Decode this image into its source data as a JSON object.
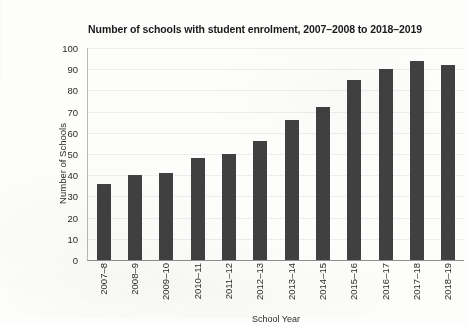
{
  "chart_data": {
    "type": "bar",
    "title": "Number of schools with student enrolment, 2007–2008 to 2018–2019",
    "xlabel": "School Year",
    "ylabel": "Number of Schools",
    "categories": [
      "2007–8",
      "2008–9",
      "2009–10",
      "2010–11",
      "2011–12",
      "2012–13",
      "2013–14",
      "2014–15",
      "2015–16",
      "2016–17",
      "2017–18",
      "2018–19"
    ],
    "values": [
      36,
      40,
      41,
      48,
      50,
      56,
      66,
      72,
      85,
      90,
      94,
      92
    ],
    "ylim": [
      0,
      100
    ],
    "ytick_step": 10,
    "yticks": [
      100,
      90,
      80,
      70,
      60,
      50,
      40,
      30,
      20,
      10,
      0
    ],
    "grid": true,
    "grid_axis": "y",
    "legend": false,
    "bar_color": "#404040",
    "grid_color": "#ededed",
    "background_color": "#fdfdfb",
    "text_color": "#2b2b2b"
  }
}
